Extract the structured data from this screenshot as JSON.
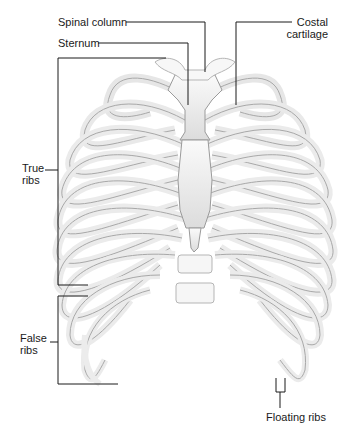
{
  "diagram": {
    "labels": {
      "spinal_column": "Spinal column",
      "sternum": "Sternum",
      "costal_cartilage_line1": "Costal",
      "costal_cartilage_line2": "cartilage",
      "true_ribs_line1": "True",
      "true_ribs_line2": "ribs",
      "false_ribs_line1": "False",
      "false_ribs_line2": "ribs",
      "floating_ribs": "Floating ribs"
    },
    "colors": {
      "bone": "#f4f4f4",
      "bone_outline": "#9a9a9a",
      "leader_line": "#1a1a1a",
      "background": "#ffffff"
    }
  }
}
